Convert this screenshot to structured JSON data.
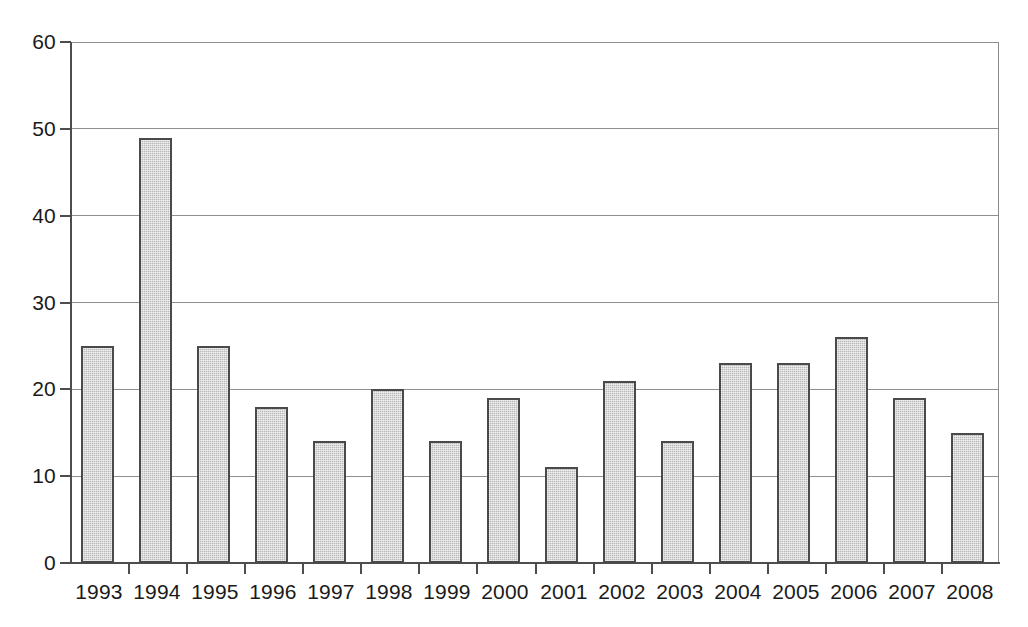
{
  "chart_data": {
    "type": "bar",
    "title": "",
    "subtitle": "",
    "xlabel": "",
    "ylabel": "",
    "categories": [
      "1993",
      "1994",
      "1995",
      "1996",
      "1997",
      "1998",
      "1999",
      "2000",
      "2001",
      "2002",
      "2003",
      "2004",
      "2005",
      "2006",
      "2007",
      "2008"
    ],
    "values": [
      25,
      49,
      25,
      18,
      14,
      20,
      14,
      19,
      11,
      21,
      14,
      23,
      23,
      26,
      19,
      15
    ],
    "ylim": [
      0,
      60
    ],
    "yticks": [
      0,
      10,
      20,
      30,
      40,
      50,
      60
    ],
    "ytick_labels": [
      "0",
      "10",
      "20",
      "30",
      "40",
      "50",
      "60"
    ],
    "grid": true,
    "grid_axis": "y",
    "legend": false,
    "legend_position": "none",
    "annotations": [],
    "bar_color": "#b9b9b9",
    "bar_edge_color": "#4a4a4a",
    "grid_color": "#8f8f8f",
    "axis_color": "#4d4d4d",
    "background_color": "#ffffff",
    "text_color": "#1a1a1a"
  }
}
